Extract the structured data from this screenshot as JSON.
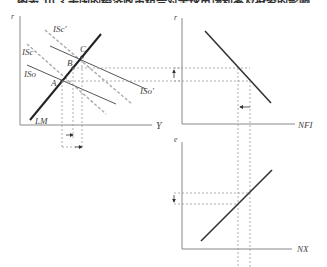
{
  "caption": "图表 10-3 美国的经济政策组合对全球市场利率及投资的影响",
  "colors": {
    "axis": "#888888",
    "curve": "#333333",
    "dashed_gray": "#aaaaaa",
    "guide": "#999999"
  },
  "panels": {
    "islm": {
      "y_axis_label": "r",
      "x_axis_label": "Y",
      "curves": {
        "lm": "LM",
        "isc_prime": "ISc'",
        "isc": "ISc",
        "iso": "ISo",
        "iso_prime": "ISo'"
      },
      "points": {
        "a": "A",
        "b": "B",
        "c": "C"
      }
    },
    "nfi": {
      "y_axis_label": "r",
      "x_axis_label": "NFI"
    },
    "nx": {
      "y_axis_label": "e",
      "x_axis_label": "NX"
    }
  }
}
